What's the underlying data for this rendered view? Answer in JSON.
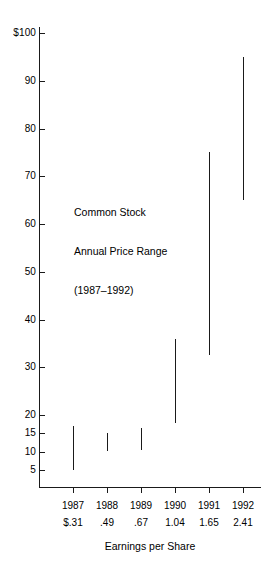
{
  "chart_data": {
    "type": "bar",
    "title": "",
    "annotation": {
      "line1": "Common Stock",
      "line2": "Annual Price Range",
      "line3": "(1987–1992)"
    },
    "xlabel": "Earnings per Share",
    "ylabel": "",
    "grid": false,
    "legend": null,
    "ylim": [
      0,
      104
    ],
    "y_ticks": [
      {
        "label": "$100",
        "value": 100
      },
      {
        "label": "90",
        "value": 90
      },
      {
        "label": "80",
        "value": 80
      },
      {
        "label": "70",
        "value": 70
      },
      {
        "label": "60",
        "value": 60
      },
      {
        "label": "50",
        "value": 50
      },
      {
        "label": "40",
        "value": 40
      },
      {
        "label": "30",
        "value": 30
      },
      {
        "label": "20",
        "value": 20
      },
      {
        "label": "15",
        "value": 15
      },
      {
        "label": "10",
        "value": 10
      },
      {
        "label": "5",
        "value": 5
      }
    ],
    "categories": [
      "1987",
      "1988",
      "1989",
      "1990",
      "1991",
      "1992"
    ],
    "eps_labels": [
      "$.31",
      ".49",
      ".67",
      "1.04",
      "1.65",
      "2.41"
    ],
    "eps_values": [
      0.31,
      0.49,
      0.67,
      1.04,
      1.65,
      2.41
    ],
    "series": [
      {
        "name": "Annual Price Range",
        "type": "high-low",
        "high": [
          17,
          15,
          16.5,
          36,
          75,
          95
        ],
        "low": [
          5,
          10,
          10.5,
          18,
          32.5,
          65
        ]
      }
    ],
    "color": "#1a1a1a"
  },
  "axis_geometry": {
    "note": "piecewise y scale: 20-100 linear, 5-20 compressed"
  }
}
